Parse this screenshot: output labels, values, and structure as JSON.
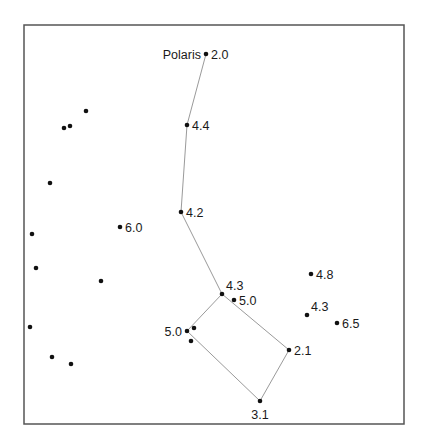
{
  "chart_data": {
    "type": "scatter",
    "title": "",
    "frame": {
      "x": 24,
      "y": 25,
      "width": 380,
      "height": 399
    },
    "colors": {
      "frame": "#555555",
      "line": "#9a9a9a",
      "star": "#111111",
      "text": "#1a1a1a"
    },
    "named_stars": [
      {
        "id": "polaris",
        "name": "Polaris",
        "magnitude": "2.0",
        "x": 206,
        "y": 54,
        "label_pos": "both"
      },
      {
        "id": "s44",
        "magnitude": "4.4",
        "x": 187,
        "y": 125,
        "label_pos": "right"
      },
      {
        "id": "s42",
        "magnitude": "4.2",
        "x": 181,
        "y": 212,
        "label_pos": "right"
      },
      {
        "id": "s43a",
        "magnitude": "4.3",
        "x": 222,
        "y": 294,
        "label_pos": "above-right"
      },
      {
        "id": "s50a",
        "magnitude": "5.0",
        "x": 234,
        "y": 300,
        "label_pos": "right"
      },
      {
        "id": "s50b",
        "magnitude": "5.0",
        "x": 187,
        "y": 331,
        "label_pos": "left"
      },
      {
        "id": "s21",
        "magnitude": "2.1",
        "x": 289,
        "y": 350,
        "label_pos": "right"
      },
      {
        "id": "s31",
        "magnitude": "3.1",
        "x": 260,
        "y": 401,
        "label_pos": "below"
      },
      {
        "id": "s60",
        "magnitude": "6.0",
        "x": 120,
        "y": 227,
        "label_pos": "right"
      },
      {
        "id": "s48",
        "magnitude": "4.8",
        "x": 311,
        "y": 274,
        "label_pos": "right"
      },
      {
        "id": "s43b",
        "magnitude": "4.3",
        "x": 307,
        "y": 315,
        "label_pos": "above-right"
      },
      {
        "id": "s65",
        "magnitude": "6.5",
        "x": 337,
        "y": 323,
        "label_pos": "right"
      }
    ],
    "unlabeled_stars": [
      {
        "x": 86,
        "y": 111
      },
      {
        "x": 64,
        "y": 128
      },
      {
        "x": 70,
        "y": 126
      },
      {
        "x": 50,
        "y": 183
      },
      {
        "x": 32,
        "y": 234
      },
      {
        "x": 36,
        "y": 268
      },
      {
        "x": 101,
        "y": 281
      },
      {
        "x": 30,
        "y": 327
      },
      {
        "x": 52,
        "y": 357
      },
      {
        "x": 71,
        "y": 364
      },
      {
        "x": 194,
        "y": 328
      },
      {
        "x": 191,
        "y": 341
      }
    ],
    "constellation_lines": [
      [
        "polaris",
        "s44"
      ],
      [
        "s44",
        "s42"
      ],
      [
        "s42",
        "s43a"
      ],
      [
        "s43a",
        "s21"
      ],
      [
        "s21",
        "s31"
      ],
      [
        "s31",
        "s50b"
      ],
      [
        "s50b",
        "s43a"
      ]
    ]
  }
}
